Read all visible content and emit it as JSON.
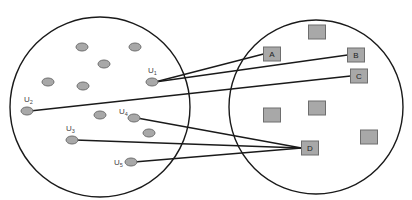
{
  "diagram": {
    "left_set": {
      "cx": 100,
      "cy": 107,
      "r": 90
    },
    "right_set": {
      "cx": 316,
      "cy": 107,
      "r": 87
    },
    "labeled_users": [
      {
        "id": "u1",
        "base": "U",
        "sub": "1",
        "x": 152,
        "y": 82,
        "lx": 148,
        "ly": 73
      },
      {
        "id": "u2",
        "base": "U",
        "sub": "2",
        "x": 27,
        "y": 111,
        "lx": 24,
        "ly": 102
      },
      {
        "id": "u3",
        "base": "U",
        "sub": "3",
        "x": 72,
        "y": 140,
        "lx": 66,
        "ly": 131
      },
      {
        "id": "u4",
        "base": "U",
        "sub": "4",
        "x": 134,
        "y": 118,
        "lx": 119,
        "ly": 114
      },
      {
        "id": "u5",
        "base": "U",
        "sub": "5",
        "x": 131,
        "y": 162,
        "lx": 114,
        "ly": 165
      }
    ],
    "unlabeled_users": [
      {
        "x": 82,
        "y": 47
      },
      {
        "x": 135,
        "y": 47
      },
      {
        "x": 104,
        "y": 64
      },
      {
        "x": 48,
        "y": 82
      },
      {
        "x": 83,
        "y": 86
      },
      {
        "x": 100,
        "y": 115
      },
      {
        "x": 149,
        "y": 133
      }
    ],
    "labeled_items": [
      {
        "id": "A",
        "label": "A",
        "x": 272,
        "y": 54
      },
      {
        "id": "B",
        "label": "B",
        "x": 356,
        "y": 55
      },
      {
        "id": "C",
        "label": "C",
        "x": 359,
        "y": 76
      },
      {
        "id": "D",
        "label": "D",
        "x": 310,
        "y": 148
      }
    ],
    "unlabeled_items": [
      {
        "x": 317,
        "y": 32
      },
      {
        "x": 272,
        "y": 115
      },
      {
        "x": 317,
        "y": 108
      },
      {
        "x": 369,
        "y": 137
      }
    ],
    "edges": [
      {
        "from": "u1",
        "to": "A"
      },
      {
        "from": "u1",
        "to": "B"
      },
      {
        "from": "u2",
        "to": "C"
      },
      {
        "from": "u4",
        "to": "D"
      },
      {
        "from": "u3",
        "to": "D"
      },
      {
        "from": "u5",
        "to": "D"
      }
    ]
  }
}
